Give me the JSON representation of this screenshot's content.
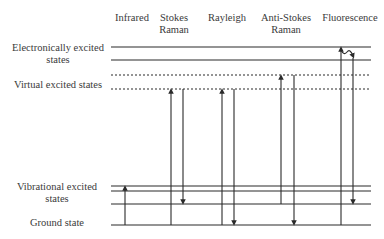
{
  "columns": {
    "infrared": "Infrared",
    "stokes_l1": "Stokes",
    "stokes_l2": "Raman",
    "rayleigh": "Rayleigh",
    "antistokes_l1": "Anti-Stokes",
    "antistokes_l2": "Raman",
    "fluorescence": "Fluorescence"
  },
  "levels": {
    "electronic_l1": "Electronically excited",
    "electronic_l2": "states",
    "virtual": "Virtual excited states",
    "vibrational_l1": "Vibrational excited",
    "vibrational_l2": "states",
    "ground": "Ground state"
  },
  "colors": {
    "line": "#2a2a2a",
    "text": "#3a3a3a"
  }
}
